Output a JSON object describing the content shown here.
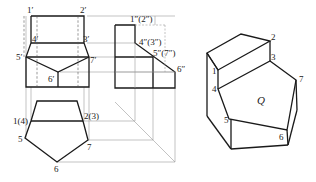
{
  "front_view": {
    "labels": {
      "p1": "1′",
      "p2": "2′",
      "p3": "3′",
      "p4": "4′",
      "p5": "5′",
      "p6": "6′",
      "p7": "7′"
    }
  },
  "side_view": {
    "labels": {
      "p12": "1″(2″)",
      "p43": "4″(3″)",
      "p57": "5″(7″)",
      "p6": "6″"
    }
  },
  "top_view": {
    "labels": {
      "p14": "1(4)",
      "p23": "2(3)",
      "p5": "5",
      "p6": "6",
      "p7": "7"
    }
  },
  "isometric_view": {
    "labels": {
      "p1": "1",
      "p2": "2",
      "p3": "3",
      "p4": "4",
      "p5": "5",
      "p6": "6",
      "p7": "7",
      "face": "Q"
    }
  }
}
